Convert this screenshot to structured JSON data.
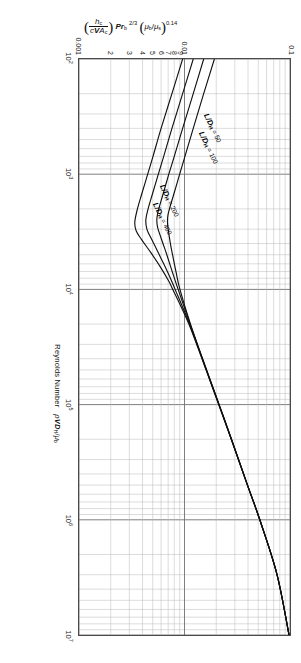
{
  "chart_data": {
    "type": "line",
    "title": "",
    "xlabel": "Reynolds Number  ρ VD_H/μ_b",
    "ylabel": "(h_c / c V A_c) Pr_b^(2/3) (μ_b/μ_s)^0.14",
    "xscale": "log",
    "yscale": "log",
    "xlim": [
      100,
      10000000
    ],
    "ylim": [
      0.001,
      0.1
    ],
    "grid": true,
    "legend_position": "inline-callouts",
    "x_ticks": [
      {
        "value": 100,
        "label": "10",
        "exp": "2"
      },
      {
        "value": 1000,
        "label": "10",
        "exp": "3"
      },
      {
        "value": 10000,
        "label": "10",
        "exp": "4"
      },
      {
        "value": 100000,
        "label": "10",
        "exp": "5"
      },
      {
        "value": 1000000,
        "label": "10",
        "exp": "6"
      },
      {
        "value": 10000000,
        "label": "10",
        "exp": "7"
      }
    ],
    "y_ticks": [
      {
        "value": 0.1,
        "label": "0.1"
      },
      {
        "value": 0.01,
        "label": "0.01"
      },
      {
        "value": 0.009,
        "label": "9"
      },
      {
        "value": 0.008,
        "label": "8"
      },
      {
        "value": 0.007,
        "label": "7"
      },
      {
        "value": 0.006,
        "label": "6"
      },
      {
        "value": 0.005,
        "label": "5"
      },
      {
        "value": 0.004,
        "label": "4"
      },
      {
        "value": 0.003,
        "label": "3"
      },
      {
        "value": 0.002,
        "label": "2"
      },
      {
        "value": 0.001,
        "label": "0.001"
      }
    ],
    "series": [
      {
        "name": "L/DH = 50",
        "label_prefix": "L",
        "label_den": "D",
        "label_sub": "H",
        "label_value": "= 50",
        "points": [
          [
            100,
            0.0192
          ],
          [
            200,
            0.0152
          ],
          [
            400,
            0.0121
          ],
          [
            700,
            0.0101
          ],
          [
            1000,
            0.009
          ],
          [
            1500,
            0.0079
          ],
          [
            2000,
            0.0072
          ],
          [
            2300,
            0.00695
          ],
          [
            2600,
            0.0069
          ],
          [
            3000,
            0.007
          ],
          [
            4000,
            0.00735
          ],
          [
            5000,
            0.0077
          ],
          [
            7000,
            0.0083
          ],
          [
            10000,
            0.00905
          ],
          [
            20000,
            0.0114
          ],
          [
            50000,
            0.0162
          ],
          [
            100000,
            0.0213
          ],
          [
            200000,
            0.0279
          ],
          [
            500000,
            0.0396
          ],
          [
            1000000,
            0.0518
          ],
          [
            3000000,
            0.0755
          ],
          [
            10000000,
            0.098
          ]
        ]
      },
      {
        "name": "L/DH = 100",
        "label_prefix": "L",
        "label_den": "D",
        "label_sub": "H",
        "label_value": "= 100",
        "points": [
          [
            100,
            0.0152
          ],
          [
            200,
            0.0121
          ],
          [
            400,
            0.0096
          ],
          [
            700,
            0.008
          ],
          [
            1000,
            0.0071
          ],
          [
            1500,
            0.00625
          ],
          [
            2000,
            0.0057
          ],
          [
            2400,
            0.00548
          ],
          [
            2800,
            0.00552
          ],
          [
            3200,
            0.00575
          ],
          [
            4000,
            0.00625
          ],
          [
            5000,
            0.0068
          ],
          [
            7000,
            0.00765
          ],
          [
            10000,
            0.0087
          ],
          [
            20000,
            0.0113
          ],
          [
            50000,
            0.01615
          ],
          [
            100000,
            0.02125
          ],
          [
            200000,
            0.02785
          ],
          [
            500000,
            0.03955
          ],
          [
            1000000,
            0.05175
          ],
          [
            3000000,
            0.07545
          ],
          [
            10000000,
            0.09795
          ]
        ]
      },
      {
        "name": "L/DH = 200",
        "label_prefix": "L",
        "label_den": "D",
        "label_sub": "H",
        "label_value": "= 200",
        "points": [
          [
            100,
            0.0121
          ],
          [
            200,
            0.0096
          ],
          [
            400,
            0.0076
          ],
          [
            700,
            0.00635
          ],
          [
            1000,
            0.00565
          ],
          [
            1500,
            0.00495
          ],
          [
            2000,
            0.00452
          ],
          [
            2500,
            0.0043
          ],
          [
            3000,
            0.0044
          ],
          [
            3500,
            0.00475
          ],
          [
            4500,
            0.00545
          ],
          [
            6000,
            0.00635
          ],
          [
            8000,
            0.00735
          ],
          [
            10000,
            0.00815
          ],
          [
            20000,
            0.01115
          ],
          [
            50000,
            0.01608
          ],
          [
            100000,
            0.02118
          ],
          [
            200000,
            0.0278
          ],
          [
            500000,
            0.0395
          ],
          [
            1000000,
            0.0517
          ],
          [
            3000000,
            0.0754
          ],
          [
            10000000,
            0.0979
          ]
        ]
      },
      {
        "name": "L/DH = 400",
        "label_prefix": "L",
        "label_den": "D",
        "label_sub": "H",
        "label_value": "= 400",
        "points": [
          [
            100,
            0.0096
          ],
          [
            200,
            0.0076
          ],
          [
            400,
            0.006
          ],
          [
            700,
            0.00503
          ],
          [
            1000,
            0.00448
          ],
          [
            1500,
            0.00392
          ],
          [
            2000,
            0.00358
          ],
          [
            2600,
            0.00338
          ],
          [
            3100,
            0.00348
          ],
          [
            3700,
            0.00392
          ],
          [
            4800,
            0.0048
          ],
          [
            6500,
            0.00598
          ],
          [
            8500,
            0.0071
          ],
          [
            10000,
            0.00775
          ],
          [
            20000,
            0.011
          ],
          [
            50000,
            0.016
          ],
          [
            100000,
            0.0211
          ],
          [
            200000,
            0.02775
          ],
          [
            500000,
            0.03945
          ],
          [
            1000000,
            0.05165
          ],
          [
            3000000,
            0.07535
          ],
          [
            10000000,
            0.09785
          ]
        ]
      }
    ],
    "annotations": [
      {
        "text": "L/D_H = 50",
        "series": 0
      },
      {
        "text": "L/D_H = 100",
        "series": 1
      },
      {
        "text": "L/D_H = 200",
        "series": 2
      },
      {
        "text": "L/D_H = 400",
        "series": 3
      }
    ],
    "colors": {
      "curve": "#101010",
      "grid_major": "#6f6f6f",
      "grid_minor": "#b9b9b9",
      "axis": "#4a4a4a"
    }
  },
  "axes": {
    "x_title_words": "Reynolds Number",
    "x_title_rho": "ρ",
    "x_title_V": "V",
    "x_title_D": "D",
    "x_title_Dsub": "H",
    "x_title_slash": "/",
    "x_title_mu": "μ",
    "x_title_musub": "b"
  },
  "ytitle": {
    "num": "h",
    "num_sub": "c",
    "den_c": "c",
    "den_V": "V",
    "den_A": "A",
    "den_A_sub": "c",
    "pr": "Pr",
    "pr_sub": "b",
    "pr_exp": "2/3",
    "mu_b": "μ",
    "mu_b_sub": "b",
    "mu_s": "μ",
    "mu_s_sub": "s",
    "mu_exp": "0.14"
  }
}
